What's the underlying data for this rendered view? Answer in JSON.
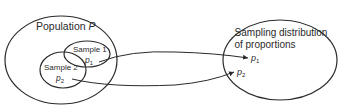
{
  "diagram": {
    "population": {
      "label": "Population ",
      "symbol": "P"
    },
    "samples": [
      {
        "label": "Sample 1",
        "stat": "p",
        "stat_sub": "1"
      },
      {
        "label": "Sample 2",
        "stat": "p",
        "stat_sub": "2"
      }
    ],
    "distribution": {
      "line1": "Sampling distribution",
      "line2": "of proportions",
      "points": [
        {
          "stat": "p",
          "stat_sub": "1"
        },
        {
          "stat": "p",
          "stat_sub": "2"
        }
      ]
    },
    "colors": {
      "stroke": "#2a2a2a",
      "background": "#ffffff"
    }
  }
}
